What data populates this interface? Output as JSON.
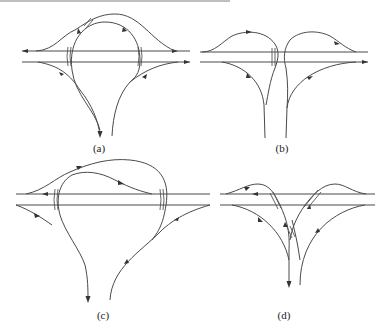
{
  "figure": {
    "panels": [
      {
        "id": "a",
        "label": "(a)",
        "description": "Cloverleaf-type interchange with two crossing loop ramps over a divided highway, T-leg below"
      },
      {
        "id": "b",
        "label": "(b)",
        "description": "Trumpet-like symmetric interchange with two loops meeting at center and diverging legs below"
      },
      {
        "id": "c",
        "label": "(c)",
        "description": "Large looping interchange with nested loops over highway, T-leg below"
      },
      {
        "id": "d",
        "label": "(d)",
        "description": "Directional T-interchange with flyover ramps crossing the highway and each other"
      }
    ]
  },
  "colors": {
    "line": "#4a4a4a",
    "background": "#ffffff",
    "text": "#222222"
  }
}
